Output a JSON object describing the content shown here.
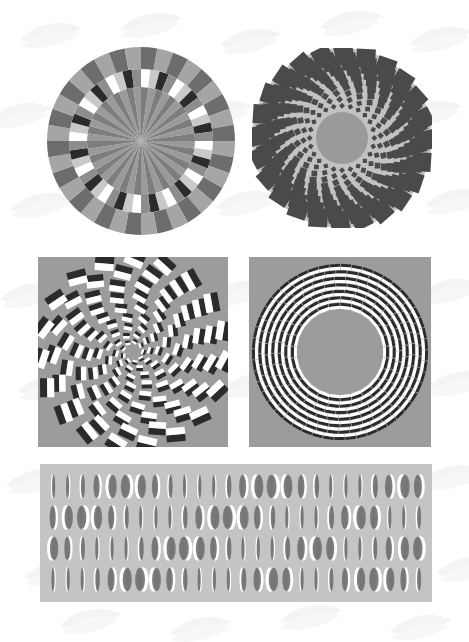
{
  "page": {
    "kind": "figure-plate",
    "background_color": "#ffffff",
    "watermark": {
      "name": "scalloped-fan-watermark",
      "color": "#e9e9e9",
      "visible": true
    },
    "width": 469,
    "height": 642
  },
  "palette": {
    "white": "#ffffff",
    "near_white": "#f2f2f2",
    "light_gray": "#c9c9c9",
    "panel_gray": "#9c9c9c",
    "mid_gray": "#8d8d8d",
    "dark_gray": "#6d6d6d",
    "darker_gray": "#595959",
    "near_black": "#333333",
    "black": "#1a1a1a"
  },
  "figures": [
    {
      "id": "fig-a",
      "name": "radial-sector-disc",
      "caption": "",
      "shape": "circle",
      "x": 47,
      "y": 47,
      "width": 188,
      "height": 188,
      "rings": [
        {
          "name": "outer-block-ring",
          "r_outer": 94,
          "r_inner": 72,
          "segments": 36,
          "colors": [
            "#6d6d6d",
            "#a5a5a5"
          ]
        },
        {
          "name": "shaded-bar-ring",
          "r_outer": 72,
          "r_inner": 54,
          "segments": 48,
          "colors": [
            "#ffffff",
            "#2b2b2b",
            "#8d8d8d",
            "#c9c9c9"
          ]
        },
        {
          "name": "inner-radial-disc",
          "r_outer": 54,
          "r_inner": 0,
          "segments": 44,
          "colors": [
            "#7d7d7d",
            "#9a9a9a"
          ]
        }
      ]
    },
    {
      "id": "fig-b",
      "name": "spiral-square-disc",
      "caption": "",
      "shape": "circle",
      "x": 252,
      "y": 48,
      "width": 180,
      "height": 180,
      "disc_color": "#c2c2c2",
      "center_color": "#9a9a9a",
      "center_radius": 26,
      "square_color": "#4a4a4a",
      "spokes": 24,
      "rings": 9
    },
    {
      "id": "fig-c",
      "name": "spiral-dash-panel",
      "caption": "",
      "shape": "rect",
      "x": 38,
      "y": 257,
      "width": 190,
      "height": 190,
      "panel_color": "#9c9c9c",
      "dash_colors": [
        "#ffffff",
        "#2b2b2b"
      ],
      "arms": 9,
      "rings": 9
    },
    {
      "id": "fig-d",
      "name": "concentric-ring-dash-panel",
      "caption": "",
      "shape": "rect",
      "x": 249,
      "y": 257,
      "width": 182,
      "height": 190,
      "panel_color": "#9c9c9c",
      "dash_colors": [
        "#ffffff",
        "#2b2b2b"
      ],
      "rings": 7,
      "inner_hole_radius": 46
    },
    {
      "id": "fig-e",
      "name": "ellipse-grid-panel",
      "caption": "",
      "shape": "rect",
      "x": 40,
      "y": 464,
      "width": 392,
      "height": 138,
      "panel_color": "#c4c4c4",
      "ellipse_color": "#7d7d7d",
      "highlight_color": "#ffffff",
      "shadow_color": "#6a6a6a",
      "rows": 4,
      "columns": 26
    }
  ]
}
